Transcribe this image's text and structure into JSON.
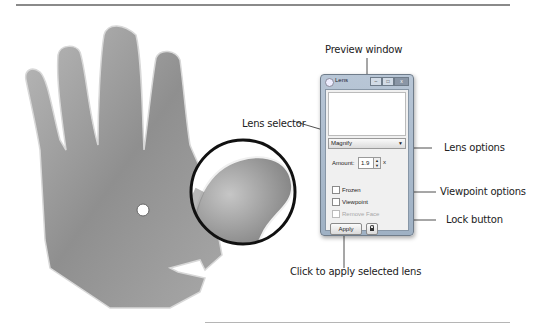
{
  "callouts": {
    "preview_window": "Preview window",
    "lens_selector": "Lens selector",
    "lens_options": "Lens options",
    "viewpoint_options": "Viewpoint options",
    "lock_button": "Lock button",
    "apply": "Click to apply selected lens"
  },
  "window": {
    "title": "Lens",
    "controls": {
      "minimize": "–",
      "maximize": "□",
      "close": "x"
    },
    "lens_select": {
      "value": "Magnify",
      "arrow": "▼"
    },
    "amount": {
      "label": "Amount:",
      "value": "1.9",
      "spin_up": "▲",
      "spin_down": "▼",
      "unit": "x"
    },
    "checkboxes": [
      {
        "label": "Frozen",
        "checked": false,
        "enabled": true
      },
      {
        "label": "Viewpoint",
        "checked": false,
        "enabled": true
      },
      {
        "label": "Remove Face",
        "checked": false,
        "enabled": false
      }
    ],
    "apply_label": "Apply",
    "lock_icon": "lock-icon"
  },
  "colors": {
    "window_frame": "#a9b9cb",
    "hand_fill": "#9a9a9a",
    "lens_ring": "#111111"
  }
}
